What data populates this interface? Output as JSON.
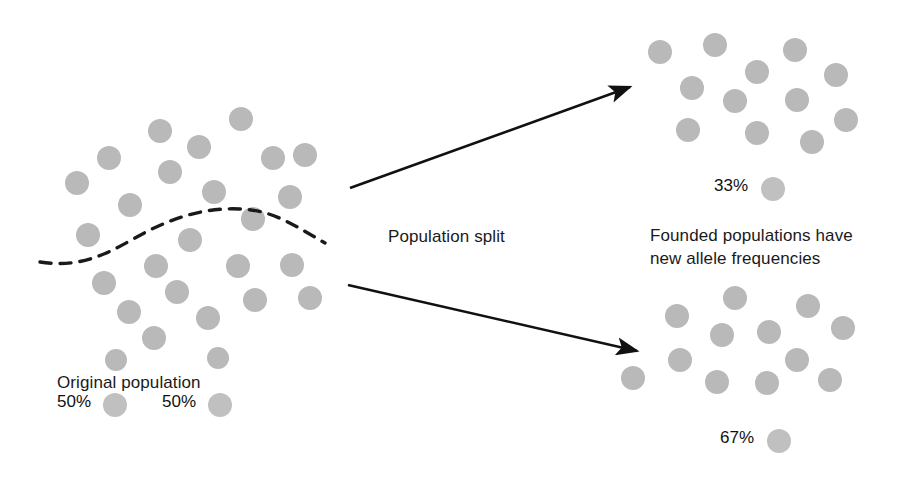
{
  "figure": {
    "title_text_blocks": {
      "original_population_label": "Original population",
      "population_split_label": "Population split",
      "founded_populations_label": "Founded populations have\nnew allele frequencies"
    },
    "colors": {
      "allele_dot": "#b9b9b9",
      "legend_swatch": "#c0c0c0",
      "arrow": "#111111",
      "dashed_divider": "#1a1a1a",
      "text": "#1a1a1a",
      "background": "#ffffff"
    },
    "legend": {
      "original": [
        {
          "percent": "50%",
          "swatch": "allele-dot-a"
        },
        {
          "percent": "50%",
          "swatch": "allele-dot-b"
        }
      ],
      "founded_top": {
        "percent": "33%",
        "swatch": "allele-dot-a"
      },
      "founded_bottom": {
        "percent": "67%",
        "swatch": "allele-dot-a"
      }
    },
    "populations": {
      "original": {
        "name": "original-population",
        "dot_count": 26,
        "dots": [
          {
            "cx": 160,
            "cy": 131,
            "r": 12
          },
          {
            "cx": 241,
            "cy": 119,
            "r": 12
          },
          {
            "cx": 109,
            "cy": 158,
            "r": 12
          },
          {
            "cx": 199,
            "cy": 147,
            "r": 12
          },
          {
            "cx": 273,
            "cy": 158,
            "r": 12
          },
          {
            "cx": 305,
            "cy": 155,
            "r": 12
          },
          {
            "cx": 77,
            "cy": 183,
            "r": 12
          },
          {
            "cx": 170,
            "cy": 172,
            "r": 12
          },
          {
            "cx": 214,
            "cy": 192,
            "r": 12
          },
          {
            "cx": 290,
            "cy": 197,
            "r": 12
          },
          {
            "cx": 130,
            "cy": 205,
            "r": 12
          },
          {
            "cx": 253,
            "cy": 219,
            "r": 12
          },
          {
            "cx": 88,
            "cy": 235,
            "r": 12
          },
          {
            "cx": 190,
            "cy": 240,
            "r": 12
          },
          {
            "cx": 156,
            "cy": 266,
            "r": 12
          },
          {
            "cx": 238,
            "cy": 266,
            "r": 12
          },
          {
            "cx": 292,
            "cy": 265,
            "r": 12
          },
          {
            "cx": 104,
            "cy": 283,
            "r": 12
          },
          {
            "cx": 177,
            "cy": 292,
            "r": 12
          },
          {
            "cx": 255,
            "cy": 300,
            "r": 12
          },
          {
            "cx": 310,
            "cy": 298,
            "r": 12
          },
          {
            "cx": 129,
            "cy": 312,
            "r": 12
          },
          {
            "cx": 208,
            "cy": 318,
            "r": 12
          },
          {
            "cx": 154,
            "cy": 338,
            "r": 12
          },
          {
            "cx": 218,
            "cy": 358,
            "r": 11
          },
          {
            "cx": 116,
            "cy": 360,
            "r": 11
          }
        ]
      },
      "founded_top": {
        "name": "founded-population-top",
        "dot_count": 12,
        "dots": [
          {
            "cx": 660,
            "cy": 52,
            "r": 12
          },
          {
            "cx": 715,
            "cy": 45,
            "r": 12
          },
          {
            "cx": 795,
            "cy": 50,
            "r": 12
          },
          {
            "cx": 757,
            "cy": 72,
            "r": 12
          },
          {
            "cx": 836,
            "cy": 75,
            "r": 12
          },
          {
            "cx": 692,
            "cy": 88,
            "r": 12
          },
          {
            "cx": 735,
            "cy": 101,
            "r": 12
          },
          {
            "cx": 797,
            "cy": 100,
            "r": 12
          },
          {
            "cx": 846,
            "cy": 120,
            "r": 12
          },
          {
            "cx": 688,
            "cy": 130,
            "r": 12
          },
          {
            "cx": 757,
            "cy": 133,
            "r": 12
          },
          {
            "cx": 812,
            "cy": 142,
            "r": 12
          }
        ]
      },
      "founded_bottom": {
        "name": "founded-population-bottom",
        "dot_count": 12,
        "dots": [
          {
            "cx": 735,
            "cy": 298,
            "r": 12
          },
          {
            "cx": 677,
            "cy": 316,
            "r": 12
          },
          {
            "cx": 808,
            "cy": 306,
            "r": 12
          },
          {
            "cx": 722,
            "cy": 335,
            "r": 12
          },
          {
            "cx": 769,
            "cy": 332,
            "r": 12
          },
          {
            "cx": 843,
            "cy": 328,
            "r": 12
          },
          {
            "cx": 680,
            "cy": 360,
            "r": 12
          },
          {
            "cx": 797,
            "cy": 360,
            "r": 12
          },
          {
            "cx": 633,
            "cy": 378,
            "r": 12
          },
          {
            "cx": 717,
            "cy": 382,
            "r": 12
          },
          {
            "cx": 767,
            "cy": 383,
            "r": 12
          },
          {
            "cx": 830,
            "cy": 380,
            "r": 12
          }
        ]
      }
    },
    "divider": {
      "name": "dashed-population-divider",
      "path": "M 40 262 C 80 268, 105 255, 135 238 C 165 221, 200 207, 240 209 C 272 210, 292 224, 325 243",
      "dash": "11 9",
      "stroke_width": 3.4
    },
    "arrows": [
      {
        "name": "arrow-to-top-population",
        "x1": 350,
        "y1": 188,
        "x2": 630,
        "y2": 87,
        "stroke_width": 2.6
      },
      {
        "name": "arrow-to-bottom-population",
        "x1": 348,
        "y1": 285,
        "x2": 637,
        "y2": 351,
        "stroke_width": 2.6
      }
    ],
    "label_positions": {
      "original_population": {
        "x": 57,
        "y": 372
      },
      "population_split": {
        "x": 388,
        "y": 226
      },
      "founded_populations": {
        "x": 650,
        "y": 225
      },
      "legend_50_a_text": {
        "x": 57,
        "y": 392
      },
      "legend_50_a_dot": {
        "x": 103,
        "y": 393
      },
      "legend_50_b_text": {
        "x": 162,
        "y": 392
      },
      "legend_50_b_dot": {
        "x": 208,
        "y": 393
      },
      "legend_33_text": {
        "x": 714,
        "y": 176
      },
      "legend_33_dot": {
        "x": 761,
        "y": 177
      },
      "legend_67_text": {
        "x": 720,
        "y": 428
      },
      "legend_67_dot": {
        "x": 767,
        "y": 429
      }
    }
  }
}
